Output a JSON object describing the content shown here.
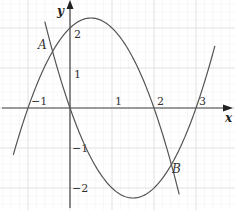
{
  "chart_data": {
    "type": "line",
    "title": "",
    "xlabel": "x",
    "ylabel": "y",
    "xlim": [
      -1.67,
      3.93
    ],
    "ylim": [
      -2.55,
      2.7
    ],
    "grid": true,
    "grid_minor_step": 0.2,
    "xticks": [
      {
        "value": -1,
        "label": "−1"
      },
      {
        "value": 1,
        "label": "1"
      },
      {
        "value": 2,
        "label": "2"
      },
      {
        "value": 3,
        "label": "3"
      }
    ],
    "yticks": [
      {
        "value": 2,
        "label": "2"
      },
      {
        "value": 1,
        "label": "1"
      },
      {
        "value": -1,
        "label": "−1"
      },
      {
        "value": -2,
        "label": "−2"
      }
    ],
    "series": [
      {
        "name": "y = -x^2 + x + 2",
        "coeffs": [
          -1,
          1,
          2
        ],
        "x_range": [
          -1.35,
          2.6
        ],
        "color": "#555555"
      },
      {
        "name": "y = x^2 - 3x",
        "coeffs": [
          1,
          -3,
          0
        ],
        "x_range": [
          -0.6,
          3.45
        ],
        "color": "#555555"
      }
    ],
    "annotations": [
      {
        "label": "A",
        "x": -0.414,
        "y": 1.586
      },
      {
        "label": "B",
        "x": 2.414,
        "y": -1.414
      }
    ]
  },
  "axis": {
    "x_label": "x",
    "y_label": "y"
  },
  "points": {
    "A": "A",
    "B": "B"
  }
}
